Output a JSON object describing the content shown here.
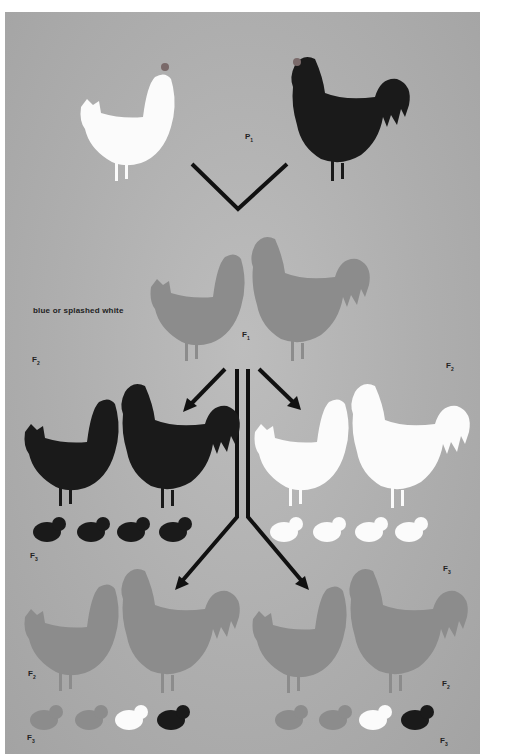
{
  "figure": {
    "title": "",
    "colors": {
      "background": "#ffffff",
      "panel": "#afafaf",
      "black_bird": "#1a1a1a",
      "white_bird": "#fbfbfb",
      "blue_bird": "#8c8c8c",
      "comb": "#6e6e6e",
      "legs": "#8e8e8e",
      "arrow": "#111111"
    },
    "caption": "blue or splashed white",
    "generation_labels": {
      "p1": {
        "letter": "P",
        "sub": "1"
      },
      "f1": {
        "letter": "F",
        "sub": "1"
      },
      "f2_left_top": {
        "letter": "F",
        "sub": "2"
      },
      "f2_right_top": {
        "letter": "F",
        "sub": "2"
      },
      "f3_left_mid": {
        "letter": "F",
        "sub": "3"
      },
      "f3_right_mid": {
        "letter": "F",
        "sub": "3"
      },
      "f2_left_bottom": {
        "letter": "F",
        "sub": "2"
      },
      "f2_right_bottom": {
        "letter": "F",
        "sub": "2"
      },
      "f3_left_bottom": {
        "letter": "F",
        "sub": "3"
      },
      "f3_right_bottom": {
        "letter": "F",
        "sub": "3"
      }
    },
    "groups": [
      {
        "generation": "P1",
        "birds": [
          "white hen",
          "black rooster"
        ]
      },
      {
        "generation": "F1",
        "birds": [
          "blue hen",
          "blue rooster"
        ]
      },
      {
        "generation": "F2 (black x black)",
        "birds": [
          "black hen",
          "black rooster"
        ],
        "chicks": [
          "black",
          "black",
          "black",
          "black"
        ]
      },
      {
        "generation": "F2 (white x white)",
        "birds": [
          "white hen",
          "white rooster"
        ],
        "chicks": [
          "white",
          "white",
          "white",
          "white"
        ]
      },
      {
        "generation": "F2 (blue x blue) left",
        "birds": [
          "blue hen",
          "blue rooster"
        ],
        "chicks": [
          "blue",
          "blue",
          "white",
          "black"
        ]
      },
      {
        "generation": "F2 (blue x blue) right",
        "birds": [
          "blue hen",
          "blue rooster"
        ],
        "chicks": [
          "blue",
          "blue",
          "white",
          "black"
        ]
      }
    ]
  }
}
